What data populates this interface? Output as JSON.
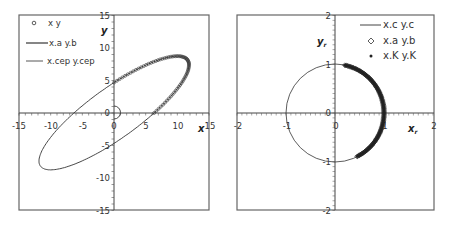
{
  "chart_data": [
    {
      "type": "scatter",
      "title": "",
      "xlabel": "x",
      "ylabel": "y",
      "xlim": [
        -15,
        15
      ],
      "ylim": [
        -15,
        15
      ],
      "xticks": [
        "-15",
        "-10",
        "-5",
        "0",
        "5",
        "10",
        "15"
      ],
      "yticks": [
        "15",
        "10",
        "5",
        "0",
        "-5",
        "-10",
        "-15"
      ],
      "grid": false,
      "legend_position": "upper-left",
      "legend": [
        "x y",
        "x.a y.b",
        "x.cep y.cep"
      ],
      "series": [
        {
          "name": "x y",
          "style": "open-circle markers",
          "description": "marker arc along upper-right of ellipse from about (0,5) through (10,8.5), (12,6) to about (7,0)"
        },
        {
          "name": "x.a y.b",
          "style": "line",
          "description": "tilted ellipse centered at origin, extents approx x in [-12,12], y in [-8.5,8.5], intercepts y=±5, x=±7"
        },
        {
          "name": "x.cep y.cep",
          "style": "thin line",
          "description": "small semicircle near origin, radius about 1, right half"
        }
      ]
    },
    {
      "type": "scatter",
      "title": "",
      "xlabel": "x_r",
      "ylabel": "y_r",
      "xlim": [
        -2,
        2
      ],
      "ylim": [
        -2,
        2
      ],
      "xticks": [
        "-2",
        "-1",
        "0",
        "1",
        "2"
      ],
      "yticks": [
        "2",
        "1",
        "0",
        "-1",
        "-2"
      ],
      "grid": false,
      "legend_position": "upper-right",
      "legend": [
        "x.c y.c",
        "x.a y.b",
        "x.K y.K"
      ],
      "series": [
        {
          "name": "x.c y.c",
          "style": "line",
          "description": "unit circle centered at origin"
        },
        {
          "name": "x.a y.b",
          "style": "open-diamond markers",
          "description": "dense arc on unit circle from about (0.2,0.98) through (1,0) to about (0.45,-0.89)"
        },
        {
          "name": "x.K y.K",
          "style": "filled-dot markers",
          "description": "dense arc overlapping x.a y.b on right side of unit circle"
        }
      ]
    }
  ],
  "left": {
    "xlabel": "x",
    "ylabel": "y",
    "xticks": [
      "-15",
      "-10",
      "-5",
      "0",
      "5",
      "10",
      "15"
    ],
    "yticks": [
      "15",
      "10",
      "5",
      "0",
      "-5",
      "-10",
      "-15"
    ],
    "legend": [
      "x y",
      "x.a y.b",
      "x.cep y.cep"
    ]
  },
  "right": {
    "xlabel": "x",
    "xlabel_sub": "r",
    "ylabel": "y",
    "ylabel_sub": "r",
    "xticks": [
      "-2",
      "-1",
      "0",
      "1",
      "2"
    ],
    "yticks": [
      "2",
      "1",
      "0",
      "-1",
      "-2"
    ],
    "legend": [
      "x.c y.c",
      "x.a y.b",
      "x.K y.K"
    ]
  },
  "colors": {
    "frame": "#555555",
    "line": "#333333",
    "marker": "#333333"
  }
}
